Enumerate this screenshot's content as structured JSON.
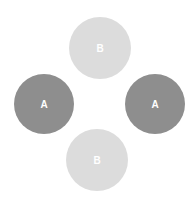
{
  "diagram": {
    "circles": [
      {
        "id": "top",
        "label": "B",
        "cx": 100,
        "cy": 48,
        "r": 31,
        "color": "#dcdcdc"
      },
      {
        "id": "left",
        "label": "A",
        "cx": 44,
        "cy": 104,
        "r": 30,
        "color": "#8e8e8e"
      },
      {
        "id": "right",
        "label": "A",
        "cx": 155,
        "cy": 104,
        "r": 30,
        "color": "#8e8e8e"
      },
      {
        "id": "bottom",
        "label": "B",
        "cx": 97,
        "cy": 160,
        "r": 31,
        "color": "#dcdcdc"
      }
    ]
  }
}
